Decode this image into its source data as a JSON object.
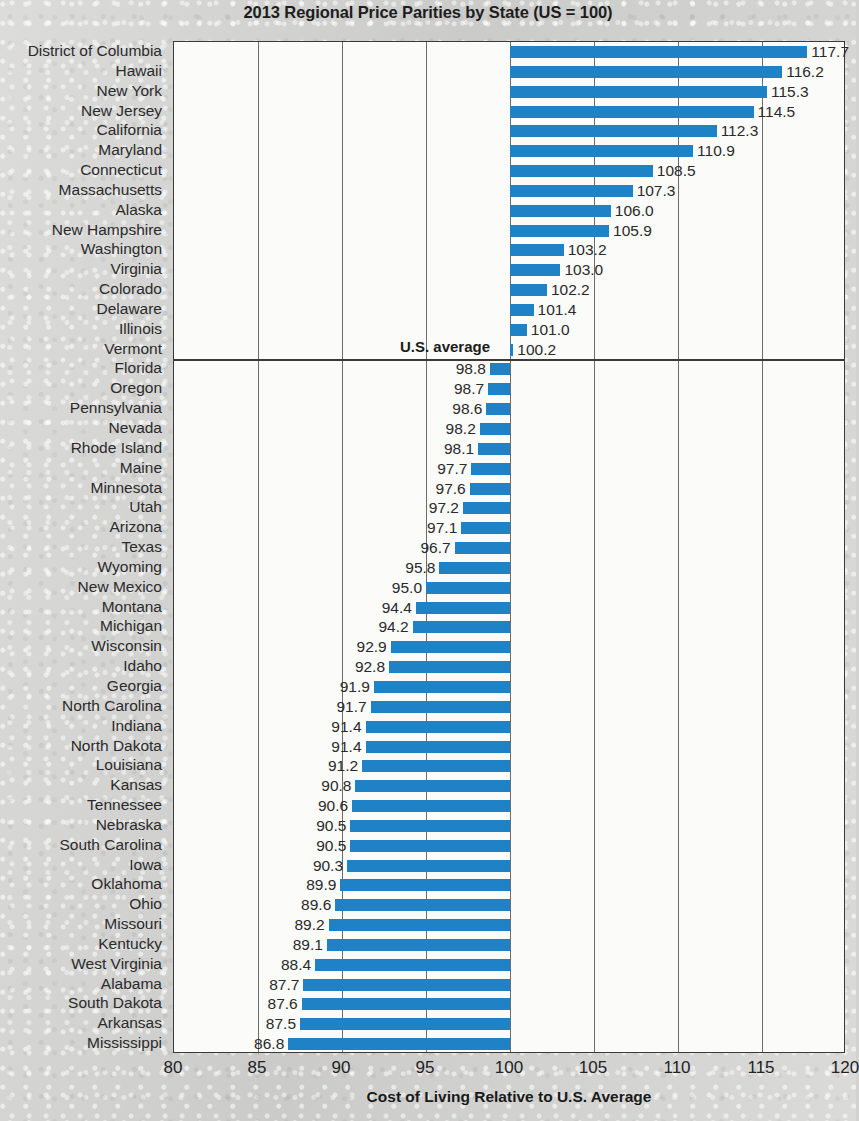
{
  "chart_data": {
    "type": "bar",
    "orientation": "horizontal",
    "title": "2013 Regional Price Parities by State (US = 100)",
    "xlabel": "Cost of Living Relative to U.S. Average",
    "ylabel": "",
    "xlim": [
      80,
      120
    ],
    "xticks": [
      80,
      85,
      90,
      95,
      100,
      105,
      110,
      115,
      120
    ],
    "xtick_labels": [
      "80",
      "85",
      "90",
      "95",
      "100",
      "105",
      "110",
      "115",
      "120"
    ],
    "grid": true,
    "legend": null,
    "baseline": 100,
    "bar_color": "#1f81c6",
    "annotations": [
      {
        "text": "U.S. average",
        "value": 100,
        "after_category": "Vermont"
      }
    ],
    "categories": [
      "District of Columbia",
      "Hawaii",
      "New York",
      "New Jersey",
      "California",
      "Maryland",
      "Connecticut",
      "Massachusetts",
      "Alaska",
      "New Hampshire",
      "Washington",
      "Virginia",
      "Colorado",
      "Delaware",
      "Illinois",
      "Vermont",
      "Florida",
      "Oregon",
      "Pennsylvania",
      "Nevada",
      "Rhode Island",
      "Maine",
      "Minnesota",
      "Utah",
      "Arizona",
      "Texas",
      "Wyoming",
      "New Mexico",
      "Montana",
      "Michigan",
      "Wisconsin",
      "Idaho",
      "Georgia",
      "North Carolina",
      "Indiana",
      "North Dakota",
      "Louisiana",
      "Kansas",
      "Tennessee",
      "Nebraska",
      "South Carolina",
      "Iowa",
      "Oklahoma",
      "Ohio",
      "Missouri",
      "Kentucky",
      "West Virginia",
      "Alabama",
      "South Dakota",
      "Arkansas",
      "Mississippi"
    ],
    "values": [
      117.7,
      116.2,
      115.3,
      114.5,
      112.3,
      110.9,
      108.5,
      107.3,
      106.0,
      105.9,
      103.2,
      103.0,
      102.2,
      101.4,
      101.0,
      100.2,
      98.8,
      98.7,
      98.6,
      98.2,
      98.1,
      97.7,
      97.6,
      97.2,
      97.1,
      96.7,
      95.8,
      95.0,
      94.4,
      94.2,
      92.9,
      92.8,
      91.9,
      91.7,
      91.4,
      91.4,
      91.2,
      90.8,
      90.6,
      90.5,
      90.5,
      90.3,
      89.9,
      89.6,
      89.2,
      89.1,
      88.4,
      87.7,
      87.6,
      87.5,
      86.8
    ],
    "value_labels": [
      "117.7",
      "116.2",
      "115.3",
      "114.5",
      "112.3",
      "110.9",
      "108.5",
      "107.3",
      "106.0",
      "105.9",
      "103.2",
      "103.0",
      "102.2",
      "101.4",
      "101.0",
      "100.2",
      "98.8",
      "98.7",
      "98.6",
      "98.2",
      "98.1",
      "97.7",
      "97.6",
      "97.2",
      "97.1",
      "96.7",
      "95.8",
      "95.0",
      "94.4",
      "94.2",
      "92.9",
      "92.8",
      "91.9",
      "91.7",
      "91.4",
      "91.4",
      "91.2",
      "90.8",
      "90.6",
      "90.5",
      "90.5",
      "90.3",
      "89.9",
      "89.6",
      "89.2",
      "89.1",
      "88.4",
      "87.7",
      "87.6",
      "87.5",
      "86.8"
    ]
  }
}
